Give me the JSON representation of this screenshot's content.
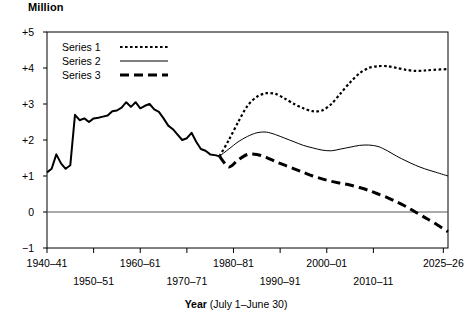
{
  "chart_data": {
    "type": "line",
    "title": "",
    "ylabel": "Million",
    "xlabel_bold": "Year",
    "xlabel_rest": " (July 1–June 30)",
    "grid": false,
    "legend_position": "top-left",
    "ylim": [
      -1,
      5
    ],
    "ytick_labels": [
      "+5",
      "+4",
      "+3",
      "+2",
      "+1",
      "0",
      "−1"
    ],
    "ytick_values": [
      5,
      4,
      3,
      2,
      1,
      0,
      -1
    ],
    "xlim": [
      1940,
      2026
    ],
    "xtick_values": [
      1940,
      1950,
      1960,
      1970,
      1980,
      1990,
      2000,
      2010,
      2025
    ],
    "xtick_labels": [
      "1940–41",
      "1950–51",
      "1960–61",
      "1970–71",
      "1980–81",
      "1990–91",
      "2000–01",
      "2010–11",
      "2025–26"
    ],
    "zero_line": 0,
    "split_year": 1977,
    "split_value": 1.55,
    "series": [
      {
        "name": "Series 1",
        "style": "dotted",
        "x": [
          1977,
          1979,
          1981,
          1983,
          1985,
          1987,
          1989,
          1991,
          1993,
          1995,
          1997,
          1999,
          2001,
          2003,
          2005,
          2007,
          2009,
          2011,
          2013,
          2015,
          2017,
          2019,
          2021,
          2023,
          2026
        ],
        "values": [
          1.55,
          2.0,
          2.5,
          2.95,
          3.2,
          3.3,
          3.28,
          3.15,
          3.0,
          2.88,
          2.8,
          2.82,
          3.0,
          3.3,
          3.6,
          3.85,
          4.0,
          4.05,
          4.05,
          4.0,
          3.95,
          3.92,
          3.93,
          3.95,
          3.97
        ]
      },
      {
        "name": "Series 2",
        "style": "thin-solid",
        "x": [
          1977,
          1979,
          1981,
          1983,
          1985,
          1987,
          1989,
          1991,
          1993,
          1995,
          1997,
          1999,
          2001,
          2003,
          2005,
          2007,
          2009,
          2011,
          2013,
          2015,
          2017,
          2019,
          2021,
          2023,
          2026
        ],
        "values": [
          1.55,
          1.75,
          1.95,
          2.1,
          2.2,
          2.22,
          2.15,
          2.05,
          1.95,
          1.85,
          1.78,
          1.72,
          1.7,
          1.75,
          1.8,
          1.85,
          1.86,
          1.82,
          1.7,
          1.55,
          1.42,
          1.3,
          1.2,
          1.12,
          1.0
        ]
      },
      {
        "name": "Series 3",
        "style": "thick-dashed",
        "x": [
          1977,
          1979,
          1981,
          1983,
          1985,
          1987,
          1989,
          1991,
          1993,
          1995,
          1997,
          1999,
          2001,
          2003,
          2005,
          2007,
          2009,
          2011,
          2013,
          2015,
          2017,
          2019,
          2021,
          2023,
          2026
        ],
        "values": [
          1.55,
          1.25,
          1.45,
          1.6,
          1.6,
          1.52,
          1.4,
          1.3,
          1.2,
          1.1,
          1.0,
          0.92,
          0.85,
          0.8,
          0.75,
          0.68,
          0.6,
          0.5,
          0.4,
          0.28,
          0.15,
          0.0,
          -0.15,
          -0.3,
          -0.55
        ]
      },
      {
        "name": "Historical",
        "style": "thick-solid",
        "x": [
          1940,
          1941,
          1942,
          1943,
          1944,
          1945,
          1946,
          1947,
          1948,
          1949,
          1950,
          1951,
          1952,
          1953,
          1954,
          1955,
          1956,
          1957,
          1958,
          1959,
          1960,
          1961,
          1962,
          1963,
          1964,
          1965,
          1966,
          1967,
          1968,
          1969,
          1970,
          1971,
          1972,
          1973,
          1974,
          1975,
          1976,
          1977
        ],
        "values": [
          1.1,
          1.2,
          1.6,
          1.35,
          1.2,
          1.3,
          2.7,
          2.55,
          2.6,
          2.5,
          2.6,
          2.62,
          2.65,
          2.68,
          2.8,
          2.82,
          2.9,
          3.05,
          2.92,
          3.05,
          2.88,
          2.95,
          3.0,
          2.85,
          2.78,
          2.6,
          2.4,
          2.3,
          2.15,
          2.0,
          2.05,
          2.2,
          1.95,
          1.75,
          1.7,
          1.6,
          1.58,
          1.55
        ]
      }
    ]
  },
  "legend": {
    "entries": [
      {
        "label": "Series 1",
        "style": "dotted"
      },
      {
        "label": "Series 2",
        "style": "thin-solid"
      },
      {
        "label": "Series 3",
        "style": "thick-dashed"
      }
    ]
  },
  "colors": {
    "ink": "#000000",
    "axis": "#000000",
    "zero_line": "#555555",
    "background": "#ffffff"
  }
}
